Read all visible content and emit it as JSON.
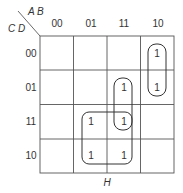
{
  "kmap": {
    "row_var_label": "C D",
    "col_var_label": "A B",
    "col_headers": [
      "00",
      "01",
      "11",
      "10"
    ],
    "row_headers": [
      "00",
      "01",
      "11",
      "10"
    ],
    "cells": [
      [
        "",
        "",
        "",
        "1"
      ],
      [
        "",
        "",
        "1",
        "1"
      ],
      [
        "",
        "1",
        "1",
        ""
      ],
      [
        "",
        "1",
        "1",
        ""
      ]
    ],
    "bottom_label": "H",
    "groups": [
      {
        "name": "group-col10-rows00-01",
        "cells": [
          [
            0,
            3
          ],
          [
            1,
            3
          ]
        ]
      },
      {
        "name": "group-col11-rows01-11",
        "cells": [
          [
            1,
            2
          ],
          [
            2,
            2
          ]
        ]
      },
      {
        "name": "group-quad-cols01-11-rows11-10",
        "cells": [
          [
            2,
            1
          ],
          [
            2,
            2
          ],
          [
            3,
            1
          ],
          [
            3,
            2
          ]
        ]
      }
    ]
  }
}
